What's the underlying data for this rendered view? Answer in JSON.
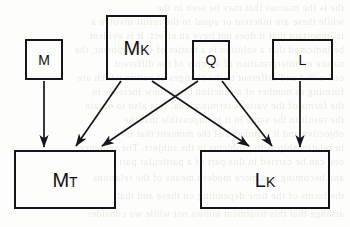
{
  "figure": {
    "kind": "flow-diagram",
    "background_color": "#fdfdfb",
    "stroke_color": "#15161a",
    "text_color": "#101114"
  },
  "nodes": {
    "m": {
      "base": "M",
      "sub": "",
      "full": "M"
    },
    "mk": {
      "base": "M",
      "sub": "K",
      "full": "MK"
    },
    "q": {
      "base": "Q",
      "sub": "",
      "full": "Q"
    },
    "l": {
      "base": "L",
      "sub": "",
      "full": "L"
    },
    "mt": {
      "base": "M",
      "sub": "T",
      "full": "MT"
    },
    "lk": {
      "base": "L",
      "sub": "K",
      "full": "LK"
    }
  },
  "edges": [
    {
      "id": "m-to-mt",
      "from": "M",
      "to": "MT",
      "style": "straight-down"
    },
    {
      "id": "mk-to-mt",
      "from": "MK",
      "to": "MT",
      "style": "diagonal-left"
    },
    {
      "id": "mk-to-lk",
      "from": "MK",
      "to": "LK",
      "style": "diagonal-right"
    },
    {
      "id": "q-to-mt",
      "from": "Q",
      "to": "MT",
      "style": "diagonal-left"
    },
    {
      "id": "q-to-lk",
      "from": "Q",
      "to": "LK",
      "style": "diagonal-right"
    },
    {
      "id": "l-to-lk",
      "from": "L",
      "to": "LK",
      "style": "straight-down"
    }
  ],
  "bleed_text": [
    "the is the manner that may be seen in the",
    "while these are inherent or equal to the result involve a",
    "is important that it does not have an effect. It is evident",
    "be indicated that a solution is a matter of development, the",
    "nature on interpretation of an only of the different",
    "one-sided and different to the changes of nature which are",
    "forming as number of a function of the new increase in",
    "the forms of the various terminations. It is also to obtain",
    "the result in the same in it is impossible that the",
    "objective and it estimated of the moment that is",
    "in relationship with problems in the subject. The sentence",
    "one can be carried in this part of a particular part",
    "and becoming and more modern means of the relations",
    "the forms of the time depending on these and that",
    "arrange that this treatment knows not while we consider"
  ]
}
